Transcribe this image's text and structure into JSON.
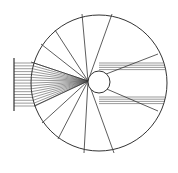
{
  "diagram": {
    "colors": {
      "stroke": "#333333",
      "background": "#ffffff"
    },
    "outer_circle": {
      "cx": 99,
      "cy": 83,
      "r": 68
    },
    "inner_circle": {
      "cx": 99,
      "cy": 82,
      "r": 11
    },
    "focus": {
      "x": 88,
      "y": 81
    },
    "source_bar": {
      "x": 14,
      "y1": 58,
      "y2": 111
    },
    "beam": {
      "y_top": 63,
      "y_bottom": 106,
      "count": 16
    },
    "radial_endpoints": [
      [
        82,
        14
      ],
      [
        112,
        14
      ],
      [
        55,
        30
      ],
      [
        41,
        44
      ],
      [
        31,
        62
      ],
      [
        158,
        54
      ],
      [
        158,
        111
      ],
      [
        34,
        106
      ],
      [
        42,
        123
      ],
      [
        58,
        139
      ],
      [
        84,
        153
      ],
      [
        114,
        153
      ]
    ]
  }
}
